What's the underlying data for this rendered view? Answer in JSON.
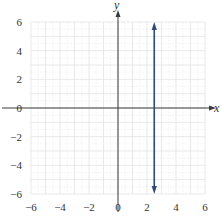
{
  "chart_data": {
    "type": "line",
    "title": "",
    "xlabel": "x",
    "ylabel": "y",
    "xlim": [
      -6,
      6
    ],
    "ylim": [
      -6,
      6
    ],
    "grid": true,
    "grid_minor_step": 1,
    "x_ticks": [
      -6,
      -4,
      -2,
      0,
      2,
      4,
      6
    ],
    "y_ticks": [
      -6,
      -4,
      -2,
      0,
      2,
      4,
      6
    ],
    "x_tick_labels": [
      "−6",
      "−4",
      "−2",
      "0",
      "2",
      "4",
      "6"
    ],
    "y_tick_labels": [
      "−6",
      "−4",
      "−2",
      "0",
      "2",
      "4",
      "6"
    ],
    "series": [
      {
        "name": "x = 2.5",
        "kind": "vertical-line",
        "x": 2.5,
        "y_range": [
          -6,
          6
        ],
        "arrows": "both",
        "color": "#2e4a7a"
      }
    ],
    "axis_color": "#3a3a3a",
    "grid_color": "#e3e3e6"
  }
}
